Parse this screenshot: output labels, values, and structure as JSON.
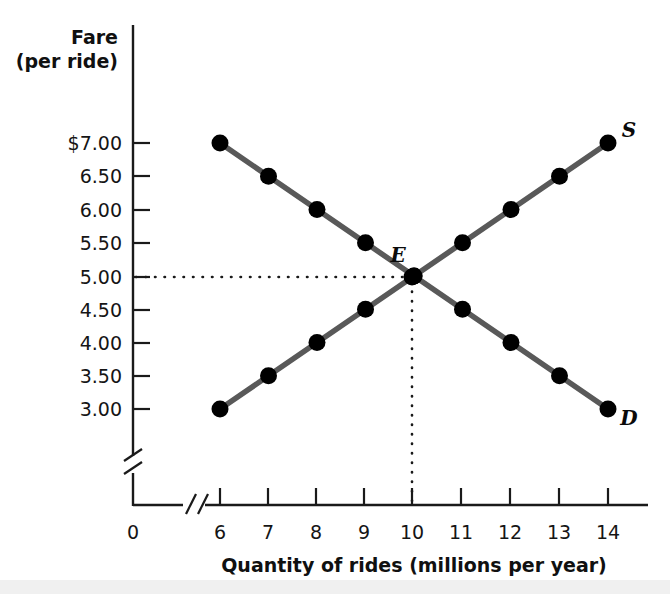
{
  "chart_data": {
    "type": "line",
    "title": "",
    "xlabel": "Quantity of rides (millions per year)",
    "ylabel": "Fare (per ride)",
    "x": [
      6,
      7,
      8,
      9,
      10,
      11,
      12,
      13,
      14
    ],
    "xticklabels": [
      "6",
      "7",
      "8",
      "9",
      "10",
      "11",
      "12",
      "13",
      "14"
    ],
    "yticklabels": [
      "$7.00",
      "6.50",
      "6.00",
      "5.50",
      "5.00",
      "4.50",
      "4.00",
      "3.50",
      "3.00"
    ],
    "yticks": [
      7.0,
      6.5,
      6.0,
      5.5,
      5.0,
      4.5,
      4.0,
      3.5,
      3.0
    ],
    "xlim": [
      6,
      14
    ],
    "ylim": [
      3.0,
      7.0
    ],
    "origin_label": "0",
    "axis_break_x": true,
    "axis_break_y": true,
    "grid": false,
    "legend": "none",
    "series": [
      {
        "name": "Demand",
        "label": "D",
        "label_position": "end-right-below",
        "color": "#595959",
        "marker": "filled-circle",
        "values": [
          7.0,
          6.5,
          6.0,
          5.5,
          5.0,
          4.5,
          4.0,
          3.5,
          3.0
        ]
      },
      {
        "name": "Supply",
        "label": "S",
        "label_position": "end-right-above",
        "color": "#595959",
        "marker": "filled-circle",
        "values": [
          3.0,
          3.5,
          4.0,
          4.5,
          5.0,
          5.5,
          6.0,
          6.5,
          7.0
        ]
      }
    ],
    "annotations": [
      {
        "name": "equilibrium",
        "label": "E",
        "x": 10,
        "y": 5.0,
        "guides": [
          "horizontal-dotted-to-y-axis",
          "vertical-dotted-to-x-axis"
        ]
      }
    ]
  },
  "labels": {
    "y_axis_title_line1": "Fare",
    "y_axis_title_line2": "(per ride)",
    "x_axis_title": "Quantity of rides (millions per year)",
    "origin": "0",
    "equilibrium": "E",
    "demand_curve": "D",
    "supply_curve": "S"
  },
  "colors": {
    "curve": "#595959",
    "marker": "#000000",
    "axis": "#1a1a1a",
    "text": "#101010",
    "background": "#ffffff"
  }
}
